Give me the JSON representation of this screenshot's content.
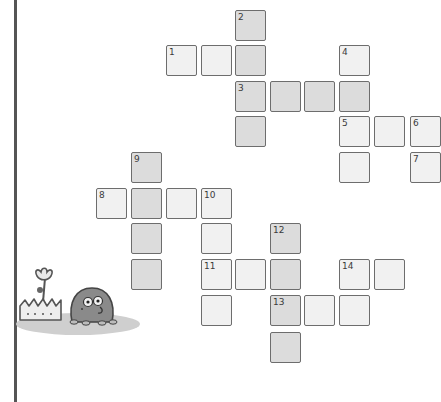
{
  "colors": {
    "cell_fill": "#f1f1f1",
    "cell_shaded_fill": "#dcdcdc",
    "cell_border": "#6d6d6d",
    "left_rule": "#555555",
    "ground": "#cfcfcf",
    "mole_body": "#8a8a8a"
  },
  "crossword": {
    "grid_pitch_px": 34.8,
    "cells": [
      {
        "row": 0,
        "col": 4,
        "number": "2",
        "shaded": true
      },
      {
        "row": 1,
        "col": 2,
        "number": "1",
        "shaded": false
      },
      {
        "row": 1,
        "col": 3,
        "number": "",
        "shaded": false
      },
      {
        "row": 1,
        "col": 4,
        "number": "",
        "shaded": true
      },
      {
        "row": 1,
        "col": 7,
        "number": "4",
        "shaded": false
      },
      {
        "row": 2,
        "col": 4,
        "number": "3",
        "shaded": true
      },
      {
        "row": 2,
        "col": 5,
        "number": "",
        "shaded": true
      },
      {
        "row": 2,
        "col": 6,
        "number": "",
        "shaded": true
      },
      {
        "row": 2,
        "col": 7,
        "number": "",
        "shaded": true
      },
      {
        "row": 3,
        "col": 4,
        "number": "",
        "shaded": true
      },
      {
        "row": 3,
        "col": 7,
        "number": "5",
        "shaded": false
      },
      {
        "row": 3,
        "col": 8,
        "number": "",
        "shaded": false
      },
      {
        "row": 3,
        "col": 9,
        "number": "6",
        "shaded": false
      },
      {
        "row": 4,
        "col": 1,
        "number": "9",
        "shaded": true
      },
      {
        "row": 4,
        "col": 7,
        "number": "",
        "shaded": false
      },
      {
        "row": 4,
        "col": 9,
        "number": "7",
        "shaded": false
      },
      {
        "row": 5,
        "col": 0,
        "number": "8",
        "shaded": false
      },
      {
        "row": 5,
        "col": 1,
        "number": "",
        "shaded": true
      },
      {
        "row": 5,
        "col": 2,
        "number": "",
        "shaded": false
      },
      {
        "row": 5,
        "col": 3,
        "number": "10",
        "shaded": false
      },
      {
        "row": 6,
        "col": 1,
        "number": "",
        "shaded": true
      },
      {
        "row": 6,
        "col": 3,
        "number": "",
        "shaded": false
      },
      {
        "row": 6,
        "col": 5,
        "number": "12",
        "shaded": true
      },
      {
        "row": 7,
        "col": 1,
        "number": "",
        "shaded": true
      },
      {
        "row": 7,
        "col": 3,
        "number": "11",
        "shaded": false
      },
      {
        "row": 7,
        "col": 4,
        "number": "",
        "shaded": false
      },
      {
        "row": 7,
        "col": 5,
        "number": "",
        "shaded": true
      },
      {
        "row": 7,
        "col": 7,
        "number": "14",
        "shaded": false
      },
      {
        "row": 7,
        "col": 8,
        "number": "",
        "shaded": false
      },
      {
        "row": 8,
        "col": 3,
        "number": "",
        "shaded": false
      },
      {
        "row": 8,
        "col": 5,
        "number": "13",
        "shaded": true
      },
      {
        "row": 8,
        "col": 6,
        "number": "",
        "shaded": false
      },
      {
        "row": 8,
        "col": 7,
        "number": "",
        "shaded": false
      },
      {
        "row": 9,
        "col": 5,
        "number": "",
        "shaded": true
      }
    ]
  },
  "illustration": {
    "icons": [
      "flower-in-grass-icon",
      "mole-icon"
    ]
  }
}
